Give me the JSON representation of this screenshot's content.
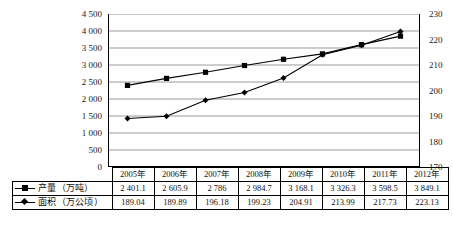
{
  "chart_data": {
    "type": "line",
    "title": "",
    "xlabel": "",
    "categories": [
      "2005年",
      "2006年",
      "2007年",
      "2008年",
      "2009年",
      "2010年",
      "2011年",
      "2012年"
    ],
    "grid": true,
    "legend_position": "table-row-labels",
    "series": [
      {
        "name": "产量（万吨）",
        "axis": "left",
        "marker": "square",
        "values": [
          2401.1,
          2605.9,
          2786,
          2984.7,
          3168.1,
          3326.3,
          3598.5,
          3849.1
        ],
        "labels": [
          "2 401.1",
          "2 605.9",
          "2 786",
          "2 984.7",
          "3 168.1",
          "3 326.3",
          "3 598.5",
          "3 849.1"
        ]
      },
      {
        "name": "面积（万公顷）",
        "axis": "right",
        "marker": "diamond",
        "values": [
          189.04,
          189.89,
          196.18,
          199.23,
          204.91,
          213.99,
          217.73,
          223.13
        ],
        "labels": [
          "189.04",
          "189.89",
          "196.18",
          "199.23",
          "204.91",
          "213.99",
          "217.73",
          "223.13"
        ]
      }
    ],
    "left_axis": {
      "ylabel": "",
      "ylim": [
        0,
        4500
      ],
      "step": 500,
      "ticks": [
        4500,
        4000,
        3500,
        3000,
        2500,
        2000,
        1500,
        1000,
        500,
        0
      ],
      "tick_labels": [
        "4 500",
        "4 000",
        "3 500",
        "3 000",
        "2 500",
        "2 000",
        "1 500",
        "1 000",
        "500",
        "0"
      ]
    },
    "right_axis": {
      "ylabel": "",
      "ylim": [
        170,
        230
      ],
      "step": 10,
      "ticks": [
        230,
        220,
        210,
        200,
        190,
        180,
        170
      ],
      "tick_labels": [
        "230",
        "220",
        "210",
        "200",
        "190",
        "180",
        "170"
      ]
    },
    "colors": {
      "line": "#000000",
      "marker": "#000000",
      "grid": "#808080",
      "axis": "#000000",
      "background": "#ffffff"
    }
  },
  "table": {
    "header_blank": "",
    "row_labels": [
      "产量（万吨）",
      "面积（万公顷）"
    ]
  }
}
